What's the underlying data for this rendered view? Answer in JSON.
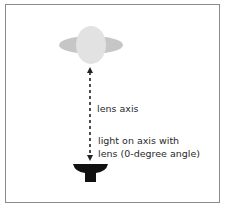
{
  "diagram": {
    "labels": {
      "axis": "lens axis",
      "light_line1": "light on axis with",
      "light_line2": "lens (0-degree angle)"
    },
    "colors": {
      "lens_outer": "#c6c6c6",
      "lens_inner": "#e2e2e2",
      "light": "#111111",
      "frame": "#8a8a8a",
      "text": "#2a2a2a"
    }
  }
}
